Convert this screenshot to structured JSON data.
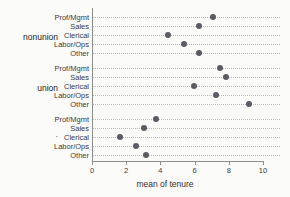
{
  "chart_data": {
    "type": "scatter",
    "title": "",
    "xlabel": "mean of tenure",
    "ylabel": "",
    "xlim": [
      0,
      10
    ],
    "xticks": [
      0,
      2,
      4,
      6,
      8,
      10
    ],
    "xtick_labels": [
      "0",
      "2",
      "4",
      "6",
      "8",
      "10"
    ],
    "grid": true,
    "legend": "none",
    "orientation": "horizontal-dot-plot",
    "categories": [
      "Prof/Mgmt",
      "Sales",
      "Clerical",
      "Labor/Ops",
      "Other"
    ],
    "groups": [
      {
        "name": "nonunion",
        "label": "nonunion",
        "values": [
          7.0,
          6.2,
          4.4,
          5.3,
          6.2
        ]
      },
      {
        "name": "union",
        "label": "union",
        "values": [
          7.4,
          7.8,
          5.9,
          7.2,
          9.1
        ]
      },
      {
        "name": "missing",
        "label": ".",
        "values": [
          3.7,
          3.0,
          1.6,
          2.5,
          3.1
        ]
      }
    ],
    "marker_color": "#5b5b63",
    "grid_color": "#b9b9b9",
    "axis_color": "#8d8d8d",
    "background": "#fbfbfa"
  }
}
